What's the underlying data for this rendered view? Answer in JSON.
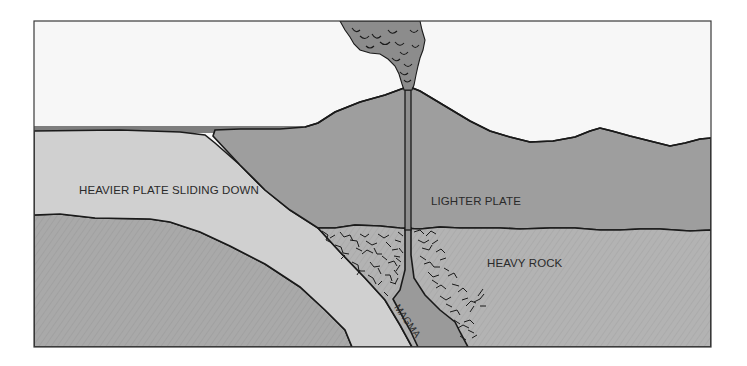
{
  "diagram": {
    "type": "cross-section",
    "labels": {
      "heavier_plate": "HEAVIER PLATE SLIDING DOWN",
      "lighter_plate": "LIGHTER PLATE",
      "heavy_rock": "HEAVY ROCK",
      "magma": "MAGMA"
    },
    "regions": [
      {
        "name": "sky",
        "color": "#f7f7f7"
      },
      {
        "name": "ocean",
        "color": "#7e7e7e"
      },
      {
        "name": "heavier-plate",
        "color": "#cfcfcf"
      },
      {
        "name": "lighter-plate",
        "color": "#9c9c9c"
      },
      {
        "name": "heavy-rock",
        "color": "#b3b3b3"
      },
      {
        "name": "lower-mantle",
        "color": "#a9a9a9"
      },
      {
        "name": "magma-chamber",
        "color": "#9a9a9a"
      },
      {
        "name": "ash-plume",
        "color": "#8c8c8c"
      }
    ],
    "features": [
      "volcano",
      "ash-plume",
      "vent-conduit",
      "magma-channel",
      "cracked-rock"
    ]
  }
}
